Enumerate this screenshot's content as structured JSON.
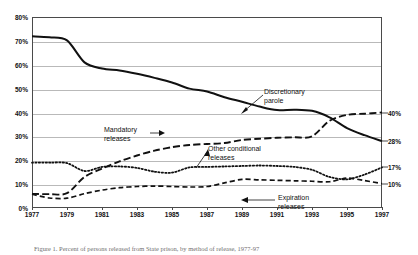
{
  "chart_data": {
    "type": "line",
    "title": "",
    "subtitle": "",
    "xlabel": "",
    "ylabel": "",
    "xlim": [
      1977,
      1997
    ],
    "ylim": [
      0,
      80
    ],
    "grid": true,
    "legend_position": "inline-annotations",
    "x": [
      1977,
      1978,
      1979,
      1980,
      1981,
      1982,
      1983,
      1984,
      1985,
      1986,
      1987,
      1988,
      1989,
      1990,
      1991,
      1992,
      1993,
      1994,
      1995,
      1996,
      1997
    ],
    "y_ticks": [
      "0%",
      "10%",
      "20%",
      "30%",
      "40%",
      "50%",
      "60%",
      "70%",
      "80%"
    ],
    "y_tick_values": [
      0,
      10,
      20,
      30,
      40,
      50,
      60,
      70,
      80
    ],
    "x_ticks": [
      "1977",
      "1979",
      "1981",
      "1983",
      "1985",
      "1987",
      "1989",
      "1991",
      "1993",
      "1995",
      "1997"
    ],
    "x_tick_values": [
      1977,
      1979,
      1981,
      1983,
      1985,
      1987,
      1989,
      1991,
      1993,
      1995,
      1997
    ],
    "right_axis_labels": [
      {
        "label": "40%",
        "value": 40
      },
      {
        "label": "28%",
        "value": 28
      },
      {
        "label": "17%",
        "value": 17
      },
      {
        "label": "10%",
        "value": 10
      }
    ],
    "series": [
      {
        "name": "Discretionary parole",
        "style": "solid",
        "annotation": {
          "line1": "Discretionary",
          "line2": "parole"
        },
        "end_value_label": "28%",
        "values": [
          71.9,
          71.5,
          70.2,
          61.0,
          58.4,
          57.6,
          56.2,
          54.5,
          52.6,
          50.0,
          48.8,
          46.4,
          44.5,
          42.5,
          41.0,
          41.2,
          40.7,
          38.0,
          33.5,
          30.5,
          28.0
        ]
      },
      {
        "name": "Mandatory releases",
        "style": "long-dash",
        "annotation": {
          "line1": "Mandatory",
          "line2": "releases"
        },
        "end_value_label": "40%",
        "values": [
          5.9,
          5.8,
          6.2,
          13.0,
          16.5,
          19.5,
          22.0,
          24.0,
          25.5,
          26.4,
          26.8,
          27.2,
          28.5,
          29.0,
          29.4,
          29.6,
          30.0,
          36.5,
          39.0,
          39.5,
          40.0
        ]
      },
      {
        "name": "Other conditional releases",
        "style": "dotted",
        "annotation": {
          "line1": "Other conditional",
          "line2": "releases"
        },
        "end_value_label": "17%",
        "values": [
          19.0,
          19.0,
          18.8,
          15.5,
          17.2,
          17.4,
          16.8,
          15.2,
          14.8,
          17.0,
          17.2,
          17.4,
          17.6,
          17.8,
          17.6,
          17.2,
          16.0,
          13.0,
          12.0,
          14.0,
          17.0
        ]
      },
      {
        "name": "Expiration releases",
        "style": "dash",
        "annotation": {
          "line1": "Expiration",
          "line2": "releases"
        },
        "end_value_label": "10%",
        "values": [
          5.8,
          4.2,
          4.1,
          6.0,
          7.5,
          8.5,
          9.0,
          9.2,
          9.0,
          8.8,
          9.0,
          10.5,
          12.0,
          11.8,
          11.6,
          11.4,
          11.2,
          11.0,
          12.5,
          11.5,
          10.2
        ]
      }
    ]
  },
  "caption": {
    "text": "Figure 1. Percent of persons released from State prison, by method of release, 1977-97"
  }
}
